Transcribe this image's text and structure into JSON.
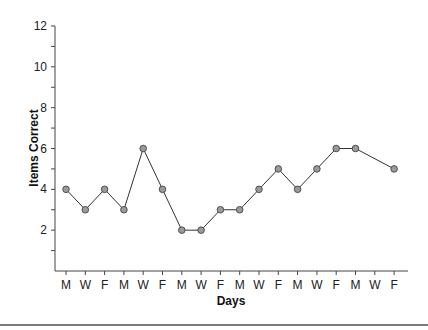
{
  "chart_data": {
    "type": "line",
    "title": "",
    "xlabel": "Days",
    "ylabel": "Items Correct",
    "categories": [
      "M",
      "W",
      "F",
      "M",
      "W",
      "F",
      "M",
      "W",
      "F",
      "M",
      "W",
      "F",
      "M",
      "W",
      "F",
      "M",
      "W",
      "F"
    ],
    "series": [
      {
        "name": "Items Correct",
        "values": [
          4,
          3,
          4,
          3,
          6,
          4,
          2,
          2,
          3,
          3,
          4,
          5,
          4,
          5,
          6,
          6,
          null,
          5
        ]
      }
    ],
    "ylim": [
      0,
      12
    ],
    "y_ticks_labeled": [
      2,
      4,
      6,
      8,
      10,
      12
    ],
    "y_ticks_minor": [
      1,
      3,
      5,
      7,
      9,
      11
    ],
    "grid": false,
    "legend": "none",
    "marker": "circle",
    "marker_color": "#9a9a9a",
    "line_color": "#333333"
  },
  "layout": {
    "plot": {
      "x0": 55,
      "y_top": 26,
      "y_axis_zero": 271,
      "x_first": 66,
      "x_step": 19.3,
      "x_end": 408
    }
  }
}
